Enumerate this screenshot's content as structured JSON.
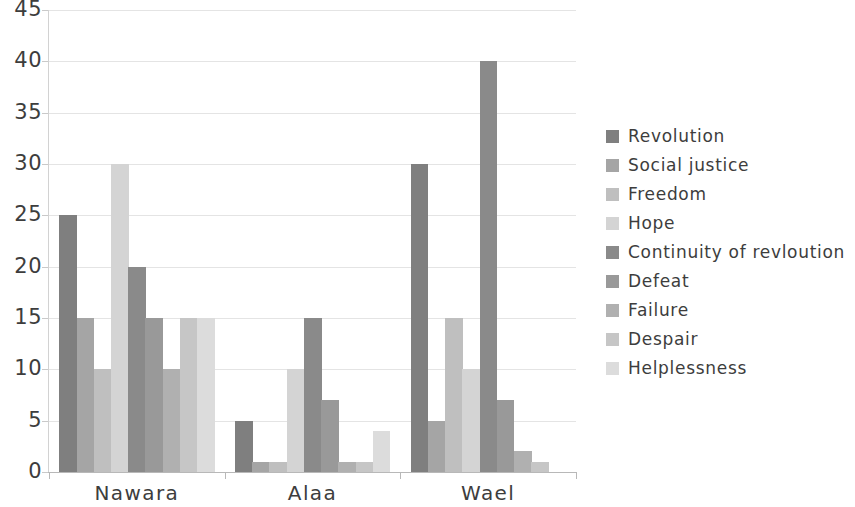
{
  "chart_data": {
    "type": "bar",
    "title": "",
    "subtitle": "",
    "xlabel": "",
    "ylabel": "",
    "categories": [
      "Nawara",
      "Alaa",
      "Wael"
    ],
    "ylim": [
      0,
      45
    ],
    "ytick_labels": [
      "0",
      "5",
      "10",
      "15",
      "20",
      "25",
      "30",
      "35",
      "40",
      "45"
    ],
    "ytick_values": [
      0,
      5,
      10,
      15,
      20,
      25,
      30,
      35,
      40,
      45
    ],
    "grid": true,
    "legend_position": "right",
    "series": [
      {
        "name": "Revolution",
        "color": "#7f7f7f",
        "values": [
          25,
          5,
          30
        ]
      },
      {
        "name": "Social justice",
        "color": "#a5a5a5",
        "values": [
          15,
          1,
          5
        ]
      },
      {
        "name": "Freedom",
        "color": "#bfbfbf",
        "values": [
          10,
          1,
          15
        ]
      },
      {
        "name": "Hope",
        "color": "#d4d4d4",
        "values": [
          30,
          10,
          10
        ]
      },
      {
        "name": "Continuity of revloution",
        "color": "#8a8a8a",
        "values": [
          20,
          15,
          40
        ]
      },
      {
        "name": "Defeat",
        "color": "#999999",
        "values": [
          15,
          7,
          7
        ]
      },
      {
        "name": "Failure",
        "color": "#b0b0b0",
        "values": [
          10,
          1,
          2
        ]
      },
      {
        "name": "Despair",
        "color": "#c6c6c6",
        "values": [
          15,
          1,
          1
        ]
      },
      {
        "name": "Helplessness",
        "color": "#dcdcdc",
        "values": [
          15,
          4,
          0
        ]
      }
    ]
  },
  "colors": {
    "axis": "#b8b8b8",
    "gridline": "#e4e4e4",
    "text": "#3d3d3d",
    "background": "#ffffff"
  }
}
